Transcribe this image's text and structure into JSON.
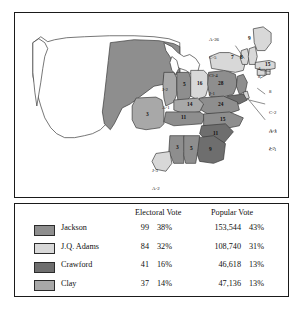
{
  "figure": {
    "kind": "electoral-map-with-results-table",
    "colors": {
      "jackson": "#8e8e8e",
      "adams": "#d8d8d8",
      "crawford": "#6e6e6e",
      "clay": "#a8a8a8",
      "unshaded_territory": "#ffffff",
      "outline": "#3a3a3a",
      "frame": "#1a1a1a",
      "text": "#111111"
    },
    "table": {
      "headers": {
        "electoral": "Electoral Vote",
        "popular": "Popular Vote"
      },
      "rows": [
        {
          "candidate": "Jackson",
          "swatch": "jackson",
          "electoral_votes": "99",
          "electoral_pct": "38%",
          "popular_votes": "153,544",
          "popular_pct": "43%"
        },
        {
          "candidate": "J.Q. Adams",
          "swatch": "adams",
          "electoral_votes": "84",
          "electoral_pct": "32%",
          "popular_votes": "108,740",
          "popular_pct": "31%"
        },
        {
          "candidate": "Crawford",
          "swatch": "crawford",
          "electoral_votes": "41",
          "electoral_pct": "16%",
          "popular_votes": "46,618",
          "popular_pct": "13%"
        },
        {
          "candidate": "Clay",
          "swatch": "clay",
          "electoral_votes": "37",
          "electoral_pct": "14%",
          "popular_votes": "47,136",
          "popular_pct": "13%"
        }
      ]
    },
    "map": {
      "state_labels": [
        {
          "id": "maine",
          "text": "9",
          "x": 247.5,
          "y": 29.0,
          "bold": true
        },
        {
          "id": "vermont",
          "text": "7",
          "x": 231.0,
          "y": 45.5,
          "bold": true
        },
        {
          "id": "new-hampshire",
          "text": "8",
          "x": 240.0,
          "y": 47.5,
          "bold": true
        },
        {
          "id": "massachusetts",
          "text": "15",
          "x": 252.0,
          "y": 48.5,
          "bold": true
        },
        {
          "id": "pennsylvania",
          "text": "28",
          "x": 203.5,
          "y": 76.0,
          "bold": true
        },
        {
          "id": "ohio",
          "text": "16",
          "x": 184.0,
          "y": 72.5,
          "bold": true
        },
        {
          "id": "indiana",
          "text": "5",
          "x": 166.5,
          "y": 73.0,
          "bold": true
        },
        {
          "id": "virginia",
          "text": "24",
          "x": 205.0,
          "y": 95.5,
          "bold": true
        },
        {
          "id": "kentucky",
          "text": "14",
          "x": 179.0,
          "y": 93.5,
          "bold": true
        },
        {
          "id": "tennessee",
          "text": "11",
          "x": 176.5,
          "y": 108.5,
          "bold": true
        },
        {
          "id": "north-carolina",
          "text": "15",
          "x": 212.0,
          "y": 110.0,
          "bold": true
        },
        {
          "id": "south-carolina",
          "text": "11",
          "x": 203.0,
          "y": 124.0,
          "bold": true
        },
        {
          "id": "georgia",
          "text": "9",
          "x": 199.5,
          "y": 142.5,
          "bold": true
        },
        {
          "id": "alabama",
          "text": "5",
          "x": 184.0,
          "y": 143.5,
          "bold": true
        },
        {
          "id": "mississippi",
          "text": "3",
          "x": 169.5,
          "y": 142.5,
          "bold": true
        },
        {
          "id": "missouri",
          "text": "3",
          "x": 135.5,
          "y": 104.0,
          "bold": true
        }
      ],
      "annotations": [
        {
          "id": "new-york-split",
          "lines": [
            "A-26",
            "C-5",
            "Cl-4",
            "J-1"
          ],
          "x": 210.0,
          "y": 21.0,
          "leader": {
            "x1": 224.0,
            "y1": 43.0,
            "x2": 233.0,
            "y2": 55.0
          }
        },
        {
          "id": "illinois-split",
          "lines": [
            "J-2",
            "A-1"
          ],
          "x": 150.5,
          "y": 69.0,
          "leader": null
        },
        {
          "id": "louisiana-split",
          "lines": [
            "J-3",
            "A-2"
          ],
          "x": 154.5,
          "y": 152.0,
          "leader": null
        },
        {
          "id": "maryland-split",
          "lines": [
            "C-2",
            "A-1",
            "J-7"
          ],
          "x": 268.0,
          "y": 94.0,
          "leader": {
            "x1": 266.0,
            "y1": 98.0,
            "x2": 256.0,
            "y2": 92.0
          }
        },
        {
          "id": "delaware-split",
          "lines": [
            "A-3",
            "C-1"
          ],
          "x": 268.0,
          "y": 112.0,
          "leader": {
            "x1": 266.0,
            "y1": 114.0,
            "x2": 255.0,
            "y2": 86.0
          }
        },
        {
          "id": "new-jersey-pointer",
          "lines": [
            "8"
          ],
          "x": 264.0,
          "y": 82.0,
          "leader": {
            "x1": 262.0,
            "y1": 84.0,
            "x2": 253.0,
            "y2": 80.0
          }
        },
        {
          "id": "rhode-island-pointer",
          "lines": [
            "4"
          ],
          "x": 262.0,
          "y": 60.0,
          "leader": {
            "x1": 261.0,
            "y1": 62.0,
            "x2": 254.0,
            "y2": 59.0
          }
        },
        {
          "id": "connecticut-pointer",
          "lines": [
            "8"
          ],
          "x": 262.0,
          "y": 68.0,
          "leader": {
            "x1": 261.0,
            "y1": 70.0,
            "x2": 252.0,
            "y2": 66.0
          }
        }
      ]
    }
  }
}
